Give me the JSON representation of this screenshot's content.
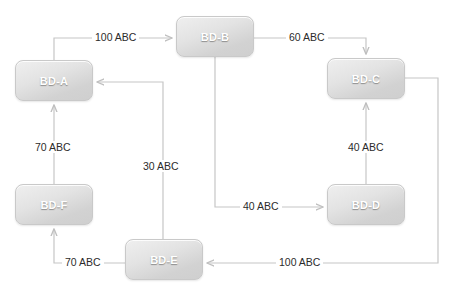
{
  "diagram": {
    "background_color": "#ffffff",
    "node_fill_color": "#e0e0e0",
    "node_border_color": "#c9c9c9",
    "node_label_color": "#ffffff",
    "edge_color": "#c0c0c0",
    "edge_label_color": "#2b2b2b",
    "nodes": [
      {
        "id": "BD-A",
        "label": "BD-A",
        "x": 15,
        "y": 60,
        "w": 78,
        "h": 41
      },
      {
        "id": "BD-B",
        "label": "BD-B",
        "x": 176,
        "y": 16,
        "w": 78,
        "h": 41
      },
      {
        "id": "BD-C",
        "label": "BD-C",
        "x": 327,
        "y": 58,
        "w": 78,
        "h": 41
      },
      {
        "id": "BD-D",
        "label": "BD-D",
        "x": 327,
        "y": 184,
        "w": 78,
        "h": 41
      },
      {
        "id": "BD-E",
        "label": "BD-E",
        "x": 125,
        "y": 239,
        "w": 78,
        "h": 41
      },
      {
        "id": "BD-F",
        "label": "BD-F",
        "x": 15,
        "y": 184,
        "w": 78,
        "h": 41
      }
    ],
    "edges": [
      {
        "id": "a-to-b",
        "from": "BD-A",
        "to": "BD-B",
        "label": "100 ABC",
        "label_x": 92,
        "label_y": 31
      },
      {
        "id": "b-to-c",
        "from": "BD-B",
        "to": "BD-C",
        "label": "60 ABC",
        "label_x": 286,
        "label_y": 31
      },
      {
        "id": "b-to-d",
        "from": "BD-B",
        "to": "BD-D",
        "label": "40 ABC",
        "label_x": 240,
        "label_y": 200
      },
      {
        "id": "d-to-c",
        "from": "BD-D",
        "to": "BD-C",
        "label": "40 ABC",
        "label_x": 345,
        "label_y": 141
      },
      {
        "id": "c-to-e",
        "from": "BD-C",
        "to": "BD-E",
        "label": "100 ABC",
        "label_x": 276,
        "label_y": 256
      },
      {
        "id": "e-to-a",
        "from": "BD-E",
        "to": "BD-A",
        "label": "30 ABC",
        "label_x": 140,
        "label_y": 160
      },
      {
        "id": "e-to-f",
        "from": "BD-E",
        "to": "BD-F",
        "label": "70 ABC",
        "label_x": 62,
        "label_y": 256
      },
      {
        "id": "f-to-a",
        "from": "BD-F",
        "to": "BD-A",
        "label": "70 ABC",
        "label_x": 32,
        "label_y": 141
      }
    ]
  }
}
